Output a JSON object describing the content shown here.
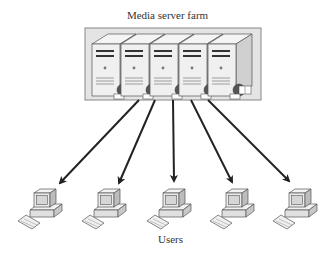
{
  "diagram": {
    "title": "Media server farm",
    "users_label": "Users",
    "server_farm": {
      "box": {
        "x": 85,
        "y": 28,
        "width": 176,
        "height": 72,
        "fill": "#e4e4e4",
        "stroke": "#888888"
      },
      "servers": [
        {
          "id": "server-1",
          "x": 92
        },
        {
          "id": "server-2",
          "x": 121
        },
        {
          "id": "server-3",
          "x": 150
        },
        {
          "id": "server-4",
          "x": 179
        },
        {
          "id": "server-5",
          "x": 208
        }
      ]
    },
    "arrows": [
      {
        "from": [
          139,
          100
        ],
        "to": [
          60,
          183
        ]
      },
      {
        "from": [
          155,
          100
        ],
        "to": [
          119,
          183
        ]
      },
      {
        "from": [
          173,
          100
        ],
        "to": [
          174,
          181
        ]
      },
      {
        "from": [
          191,
          100
        ],
        "to": [
          232,
          182
        ]
      },
      {
        "from": [
          208,
          100
        ],
        "to": [
          289,
          181
        ]
      }
    ],
    "users": [
      {
        "id": "user-1",
        "x": 37,
        "y": 182
      },
      {
        "id": "user-2",
        "x": 101,
        "y": 182
      },
      {
        "id": "user-3",
        "x": 166,
        "y": 182
      },
      {
        "id": "user-4",
        "x": 229,
        "y": 182
      },
      {
        "id": "user-5",
        "x": 292,
        "y": 182
      }
    ],
    "colors": {
      "arrow": "#222222",
      "device_fill": "#eeeeee",
      "device_stroke": "#555555",
      "globe": "#555555"
    }
  }
}
